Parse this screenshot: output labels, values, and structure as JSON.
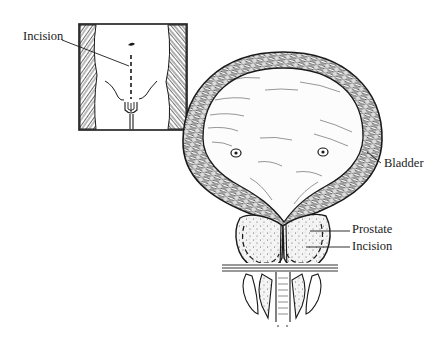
{
  "figure": {
    "type": "anatomical-illustration",
    "inset": {
      "description": "Lower abdomen with vertical dashed incision line",
      "label": "Incision"
    },
    "labels": {
      "inset_incision": "Incision",
      "bladder": "Bladder",
      "prostate": "Prostate",
      "prostate_incision": "Incision"
    },
    "colors": {
      "ink": "#1a1a1a",
      "background": "#ffffff",
      "tissue_fill": "#f2f2f2"
    }
  }
}
